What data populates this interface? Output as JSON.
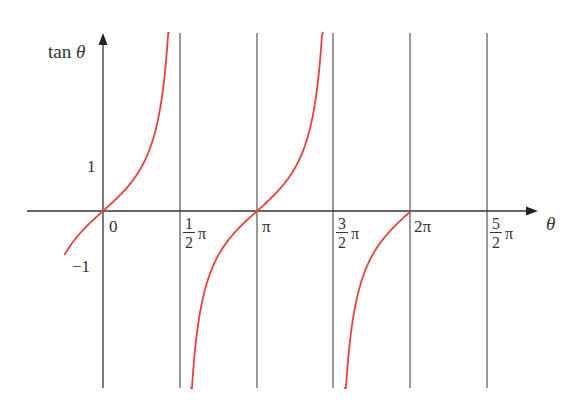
{
  "chart_data": {
    "type": "line",
    "title": "",
    "xlabel": "θ",
    "ylabel": "tan θ",
    "function": "tan(θ)",
    "x_range": [
      -0.78,
      7.85
    ],
    "y_range": [
      -4.0,
      4.0
    ],
    "origin_label": "0",
    "x_ticks": [
      {
        "value": 1.5708,
        "label": "1/2 π",
        "num": "1",
        "den": "2",
        "unit": "π"
      },
      {
        "value": 3.1416,
        "label": "π"
      },
      {
        "value": 4.7124,
        "label": "3/2 π",
        "num": "3",
        "den": "2",
        "unit": "π"
      },
      {
        "value": 6.2832,
        "label": "2π"
      },
      {
        "value": 7.854,
        "label": "5/2 π",
        "num": "5",
        "den": "2",
        "unit": "π"
      }
    ],
    "y_ticks": [
      {
        "value": 1,
        "label": "1"
      },
      {
        "value": -1,
        "label": "−1"
      }
    ],
    "asymptotes": [
      1.5708,
      4.7124
    ],
    "vertical_lines": [
      1.5708,
      3.1416,
      4.7124,
      6.2832,
      7.854
    ],
    "series": [
      {
        "name": "tan θ branch 1",
        "x_start": -0.785,
        "x_end": 1.36,
        "color": "#e8413b"
      },
      {
        "name": "tan θ branch 2",
        "x_start": 1.78,
        "x_end": 4.5,
        "color": "#e8413b"
      },
      {
        "name": "tan θ branch 3",
        "x_start": 4.92,
        "x_end": 6.28,
        "color": "#e8413b"
      }
    ],
    "grid": false,
    "legend": null,
    "colors": {
      "curve": "#e8413b",
      "axis": "#333333",
      "gridline": "#555555"
    }
  },
  "labels": {
    "ylabel": "tan θ",
    "xlabel": "θ",
    "origin": "0",
    "one": "1",
    "minus_one": "−1",
    "pi": "π",
    "two_pi": "2π",
    "half_num": "1",
    "half_den": "2",
    "three_half_num": "3",
    "three_half_den": "2",
    "five_half_num": "5",
    "five_half_den": "2",
    "pi_unit": "π",
    "tan_word": "tan",
    "theta": "θ"
  }
}
